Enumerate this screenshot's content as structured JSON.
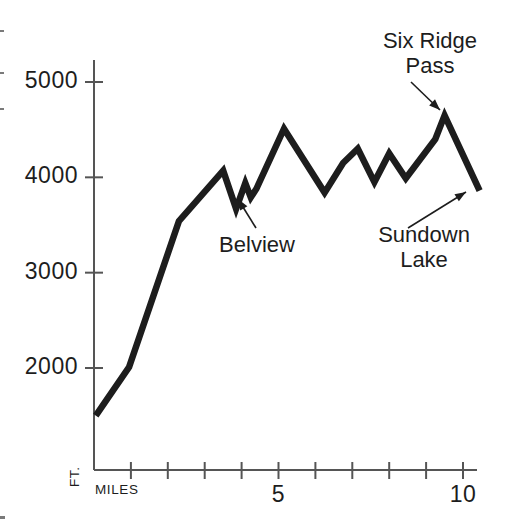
{
  "figure": {
    "background_color": "#ffffff",
    "line_color": "#1d1d1d",
    "axis_color": "#555555"
  },
  "axes": {
    "y_axis_name": "FT.",
    "x_axis_name": "MILES",
    "y_ticks": [
      {
        "value": 2000,
        "label": "2000"
      },
      {
        "value": 3000,
        "label": "3000"
      },
      {
        "value": 4000,
        "label": "4000"
      },
      {
        "value": 5000,
        "label": "5000"
      }
    ],
    "x_ticks": [
      {
        "value": 1,
        "label": ""
      },
      {
        "value": 2,
        "label": ""
      },
      {
        "value": 3,
        "label": ""
      },
      {
        "value": 4,
        "label": ""
      },
      {
        "value": 5,
        "label": "5"
      },
      {
        "value": 6,
        "label": ""
      },
      {
        "value": 7,
        "label": ""
      },
      {
        "value": 8,
        "label": ""
      },
      {
        "value": 9,
        "label": ""
      },
      {
        "value": 10,
        "label": "10"
      }
    ]
  },
  "annotations": [
    {
      "id": "six-ridge-pass",
      "lines": [
        "Six Ridge",
        "Pass"
      ],
      "text_x": 430,
      "text_y": 28,
      "arrow": {
        "x1": 411,
        "y1": 82,
        "x2": 440,
        "y2": 110
      }
    },
    {
      "id": "belview",
      "lines": [
        "Belview"
      ],
      "text_x": 257,
      "text_y": 232,
      "arrow": {
        "x1": 256,
        "y1": 228,
        "x2": 238,
        "y2": 199
      }
    },
    {
      "id": "sundown-lake",
      "lines": [
        "Sundown",
        "Lake"
      ],
      "text_x": 424,
      "text_y": 222,
      "arrow": {
        "x1": 408,
        "y1": 228,
        "x2": 466,
        "y2": 192
      }
    }
  ],
  "chart_data": {
    "type": "line",
    "title": "",
    "xlabel": "MILES",
    "ylabel": "FT.",
    "xlim": [
      0,
      10.4
    ],
    "ylim": [
      1000,
      5400
    ],
    "grid": false,
    "legend": "none",
    "series": [
      {
        "name": "Trail elevation profile",
        "x": [
          0.05,
          0.95,
          2.3,
          3.5,
          3.85,
          4.1,
          4.25,
          4.4,
          5.15,
          6.25,
          6.75,
          7.15,
          7.6,
          8.0,
          8.45,
          9.25,
          9.5,
          10.45
        ],
        "values": [
          1500,
          2010,
          3540,
          4070,
          3670,
          3940,
          3790,
          3880,
          4510,
          3840,
          4150,
          4300,
          3950,
          4250,
          3990,
          4400,
          4650,
          3860
        ]
      }
    ],
    "annotated_points": [
      {
        "label": "Belview",
        "x": 4.1,
        "y": 3940
      },
      {
        "label": "Six Ridge Pass",
        "x": 9.5,
        "y": 4650
      },
      {
        "label": "Sundown Lake",
        "x": 10.45,
        "y": 3860
      }
    ]
  }
}
